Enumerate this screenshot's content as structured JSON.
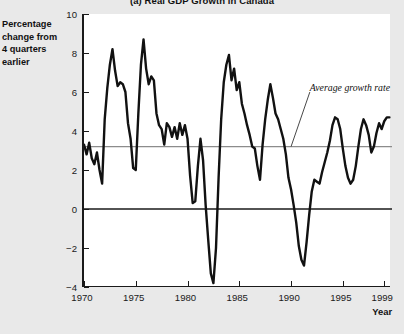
{
  "chart_data": {
    "type": "line",
    "title": "(a) Real GDP Growth in Canada",
    "xlabel": "Year",
    "ylabel": "Percentage change from 4 quarters earlier",
    "xlim": [
      1970,
      1999.75
    ],
    "ylim": [
      -4,
      10
    ],
    "grid": false,
    "legend_position": "none",
    "y_ticks": [
      10,
      8,
      6,
      4,
      2,
      0,
      "−2",
      "−4"
    ],
    "y_tick_values": [
      10,
      8,
      6,
      4,
      2,
      0,
      -2,
      -4
    ],
    "x_ticks": [
      "1970",
      "1975",
      "1980",
      "1985",
      "1990",
      "1995",
      "1999"
    ],
    "x_tick_values": [
      1970,
      1975,
      1980,
      1985,
      1990,
      1995,
      1999
    ],
    "annotations": [
      {
        "text": "Average growth rate",
        "x": 1992.2,
        "y": 6.1,
        "leader_to_x": 1990.0,
        "leader_to_y": 3.2,
        "style": "italic"
      }
    ],
    "reference_lines": [
      {
        "name": "average-growth-rate",
        "y": 3.2,
        "color": "#8c8c8c",
        "width": 1.4
      },
      {
        "name": "zero-line",
        "y": 0,
        "color": "#1a1a1a",
        "width": 1.4
      }
    ],
    "series": [
      {
        "name": "Real GDP growth (4-quarter percentage change)",
        "color": "#111111",
        "width": 2.4,
        "x": [
          1970.0,
          1970.25,
          1970.5,
          1970.75,
          1971.0,
          1971.25,
          1971.5,
          1971.75,
          1972.0,
          1972.25,
          1972.5,
          1972.75,
          1973.0,
          1973.25,
          1973.5,
          1973.75,
          1974.0,
          1974.25,
          1974.5,
          1974.75,
          1975.0,
          1975.25,
          1975.5,
          1975.75,
          1976.0,
          1976.25,
          1976.5,
          1976.75,
          1977.0,
          1977.25,
          1977.5,
          1977.75,
          1978.0,
          1978.25,
          1978.5,
          1978.75,
          1979.0,
          1979.25,
          1979.5,
          1979.75,
          1980.0,
          1980.25,
          1980.5,
          1980.75,
          1981.0,
          1981.25,
          1981.5,
          1981.75,
          1982.0,
          1982.25,
          1982.5,
          1982.75,
          1983.0,
          1983.25,
          1983.5,
          1983.75,
          1984.0,
          1984.25,
          1984.5,
          1984.75,
          1985.0,
          1985.25,
          1985.5,
          1985.75,
          1986.0,
          1986.25,
          1986.5,
          1986.75,
          1987.0,
          1987.25,
          1987.5,
          1987.75,
          1988.0,
          1988.25,
          1988.5,
          1988.75,
          1989.0,
          1989.25,
          1989.5,
          1989.75,
          1990.0,
          1990.25,
          1990.5,
          1990.75,
          1991.0,
          1991.25,
          1991.5,
          1991.75,
          1992.0,
          1992.25,
          1992.5,
          1992.75,
          1993.0,
          1993.25,
          1993.5,
          1993.75,
          1994.0,
          1994.25,
          1994.5,
          1994.75,
          1995.0,
          1995.25,
          1995.5,
          1995.75,
          1996.0,
          1996.25,
          1996.5,
          1996.75,
          1997.0,
          1997.25,
          1997.5,
          1997.75,
          1998.0,
          1998.25,
          1998.5,
          1998.75,
          1999.0,
          1999.25,
          1999.5
        ],
        "y": [
          3.3,
          2.8,
          3.4,
          2.6,
          2.3,
          2.9,
          2.0,
          1.3,
          4.6,
          6.2,
          7.4,
          8.2,
          7.1,
          6.3,
          6.5,
          6.4,
          6.0,
          4.4,
          3.6,
          2.1,
          2.0,
          4.9,
          7.4,
          8.7,
          7.2,
          6.4,
          6.8,
          6.6,
          4.9,
          4.3,
          4.1,
          3.3,
          4.4,
          4.2,
          3.7,
          4.2,
          3.6,
          4.4,
          3.8,
          4.3,
          3.6,
          1.7,
          0.3,
          0.4,
          2.2,
          3.6,
          2.5,
          0.2,
          -1.6,
          -3.3,
          -3.8,
          -2.0,
          1.6,
          4.6,
          6.5,
          7.4,
          7.9,
          6.6,
          7.2,
          6.1,
          6.5,
          5.4,
          4.9,
          4.3,
          3.8,
          3.2,
          3.1,
          2.2,
          1.5,
          3.3,
          4.6,
          5.6,
          6.4,
          5.7,
          4.9,
          4.6,
          4.1,
          3.6,
          2.8,
          1.6,
          1.0,
          0.2,
          -0.7,
          -1.9,
          -2.6,
          -2.9,
          -1.7,
          -0.3,
          0.9,
          1.5,
          1.4,
          1.3,
          1.9,
          2.4,
          2.9,
          3.5,
          4.3,
          4.7,
          4.6,
          4.1,
          3.1,
          2.2,
          1.6,
          1.3,
          1.5,
          2.2,
          3.2,
          4.1,
          4.6,
          4.3,
          3.8,
          2.9,
          3.2,
          3.9,
          4.4,
          4.1,
          4.5,
          4.7,
          4.7
        ]
      }
    ]
  }
}
